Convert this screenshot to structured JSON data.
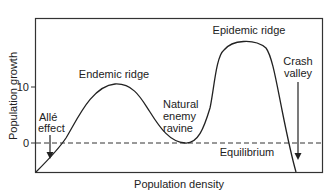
{
  "figure": {
    "x_axis_label": "Population density",
    "y_axis_label": "Population growth",
    "y_ticks": [
      {
        "label": "10",
        "value": 10
      },
      {
        "label": "0",
        "value": 0
      }
    ],
    "equilibrium_label": "Equilibrium",
    "annotations": {
      "alle_effect": [
        "Allé",
        "effect"
      ],
      "endemic_ridge": "Endemic ridge",
      "natural_enemy_ravine": [
        "Natural",
        "enemy",
        "ravine"
      ],
      "epidemic_ridge": "Epidemic ridge",
      "crash_valley": [
        "Crash",
        "valley"
      ]
    },
    "colors": {
      "line": "#222222",
      "frame": "#333333",
      "background": "#ffffff"
    }
  }
}
